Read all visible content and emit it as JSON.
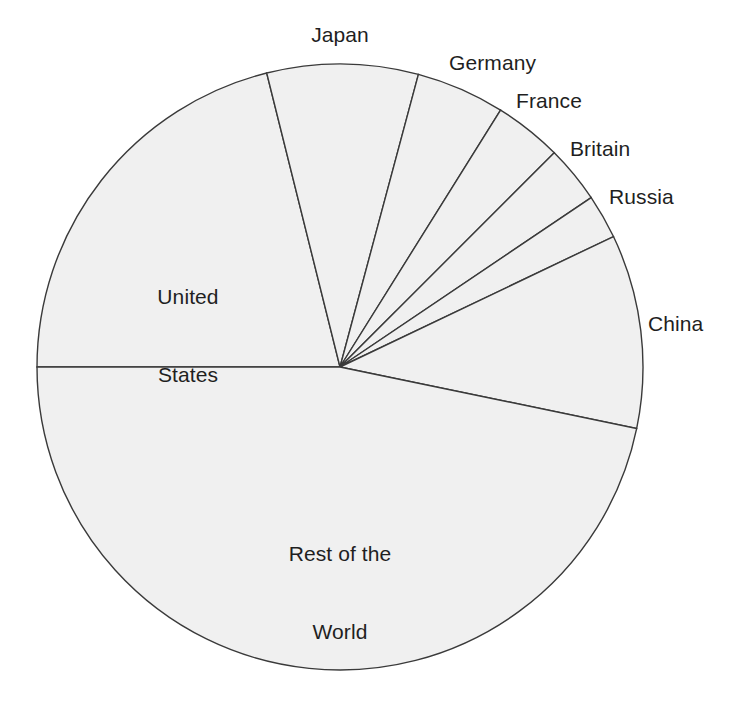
{
  "chart_data": {
    "type": "pie",
    "title": "",
    "subtitle": "",
    "xlabel": "",
    "ylabel": "",
    "legend_position": "none",
    "grid": false,
    "labels_placement": "outside-and-inside",
    "start_angle_deg": 180,
    "direction": "clockwise",
    "categories": [
      "United States",
      "Japan",
      "Germany",
      "France",
      "Britain",
      "Russia",
      "China",
      "Rest of the World"
    ],
    "values": [
      21.1,
      8.1,
      4.7,
      3.6,
      3.1,
      2.4,
      10.3,
      46.7
    ],
    "units": "percent",
    "slices": [
      {
        "name": "United States",
        "label": "United States",
        "label_line1": "United",
        "label_line2": "States",
        "percent": 21.1,
        "angle_deg": 76.0,
        "start_deg": 180.0,
        "end_deg": 104.0,
        "label_inside": true
      },
      {
        "name": "Japan",
        "label": "Japan",
        "percent": 8.1,
        "angle_deg": 29.0,
        "start_deg": 104.0,
        "end_deg": 75.0,
        "label_inside": false
      },
      {
        "name": "Germany",
        "label": "Germany",
        "percent": 4.7,
        "angle_deg": 17.0,
        "start_deg": 75.0,
        "end_deg": 58.0,
        "label_inside": false
      },
      {
        "name": "France",
        "label": "France",
        "percent": 3.6,
        "angle_deg": 13.0,
        "start_deg": 58.0,
        "end_deg": 45.0,
        "label_inside": false
      },
      {
        "name": "Britain",
        "label": "Britain",
        "percent": 3.1,
        "angle_deg": 11.0,
        "start_deg": 45.0,
        "end_deg": 34.0,
        "label_inside": false
      },
      {
        "name": "Russia",
        "label": "Russia",
        "percent": 2.4,
        "angle_deg": 8.5,
        "start_deg": 34.0,
        "end_deg": 25.5,
        "label_inside": false
      },
      {
        "name": "China",
        "label": "China",
        "percent": 10.3,
        "angle_deg": 37.2,
        "start_deg": 25.5,
        "end_deg": -11.7,
        "label_inside": false
      },
      {
        "name": "Rest of the World",
        "label": "Rest of the World",
        "label_line1": "Rest of the",
        "label_line2": "World",
        "percent": 46.7,
        "angle_deg": 168.3,
        "start_deg": -11.7,
        "end_deg": -180.0,
        "label_inside": true
      }
    ],
    "geometry": {
      "center_x": 340,
      "center_y": 367,
      "radius": 303
    },
    "colors": {
      "slice_fill": "#f0f0f0",
      "slice_stroke": "#3a3a3a",
      "label_text": "#1f1f1f",
      "background": "#ffffff"
    }
  }
}
